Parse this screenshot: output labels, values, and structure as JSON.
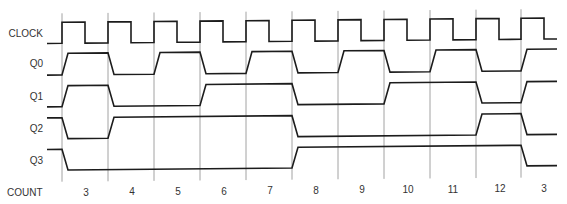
{
  "diagram": {
    "type": "timing-diagram",
    "signals": [
      {
        "name": "CLOCK",
        "kind": "clock"
      },
      {
        "name": "Q0",
        "kind": "data",
        "initial": 0,
        "values": [
          1,
          0,
          1,
          0,
          1,
          0,
          1,
          0,
          1,
          0,
          1
        ]
      },
      {
        "name": "Q1",
        "kind": "data",
        "initial": 0,
        "values": [
          1,
          0,
          0,
          1,
          1,
          0,
          0,
          1,
          1,
          0,
          1
        ]
      },
      {
        "name": "Q2",
        "kind": "data",
        "initial": 1,
        "values": [
          0,
          1,
          1,
          1,
          1,
          0,
          0,
          0,
          0,
          1,
          0
        ]
      },
      {
        "name": "Q3",
        "kind": "data",
        "initial": 1,
        "values": [
          0,
          0,
          0,
          0,
          0,
          1,
          1,
          1,
          1,
          1,
          0
        ]
      }
    ],
    "count_title": "COUNT",
    "counts": [
      "3",
      "4",
      "5",
      "6",
      "7",
      "8",
      "9",
      "10",
      "11",
      "12",
      "3"
    ]
  },
  "colors": {
    "waveform": "#1c1c1c",
    "gridline": "#8a8a8a",
    "text": "#333333",
    "background": "#ffffff"
  }
}
